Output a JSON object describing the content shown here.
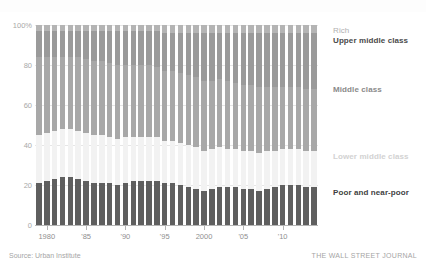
{
  "chart_data": {
    "type": "bar",
    "subtype": "stacked-percentage-column",
    "title": "",
    "xlabel": "",
    "ylabel": "",
    "ylim": [
      0,
      100
    ],
    "ytick_labels": [
      "0",
      "20",
      "40",
      "60",
      "80",
      "100%"
    ],
    "ytick_values": [
      0,
      20,
      40,
      60,
      80,
      100
    ],
    "grid": true,
    "legend_position": "right-inline",
    "x": [
      1979,
      1980,
      1981,
      1982,
      1983,
      1984,
      1985,
      1986,
      1987,
      1988,
      1989,
      1990,
      1991,
      1992,
      1993,
      1994,
      1995,
      1996,
      1997,
      1998,
      1999,
      2000,
      2001,
      2002,
      2003,
      2004,
      2005,
      2006,
      2007,
      2008,
      2009,
      2010,
      2011,
      2012,
      2013,
      2014
    ],
    "xtick_labels": [
      "1980",
      "'85",
      "'90",
      "'95",
      "2000",
      "'05",
      "'10"
    ],
    "xtick_values": [
      1980,
      1985,
      1990,
      1995,
      2000,
      2005,
      2010
    ],
    "series": [
      {
        "name": "Poor and near-poor",
        "color": "#5f5f5f",
        "values": [
          21,
          22,
          23,
          24,
          24,
          23,
          22,
          21,
          21,
          21,
          20,
          21,
          22,
          22,
          22,
          22,
          21,
          21,
          20,
          19,
          18,
          17,
          18,
          19,
          19,
          19,
          18,
          18,
          17,
          18,
          19,
          20,
          20,
          20,
          19,
          19
        ]
      },
      {
        "name": "Lower middle class",
        "color": "#f2f2f2",
        "values": [
          24,
          24,
          24,
          24,
          24,
          24,
          24,
          24,
          24,
          23,
          23,
          23,
          22,
          22,
          22,
          22,
          21,
          21,
          21,
          21,
          21,
          20,
          20,
          20,
          19,
          19,
          19,
          19,
          19,
          19,
          18,
          18,
          18,
          18,
          18,
          18
        ]
      },
      {
        "name": "Middle class",
        "color": "#a8a8a8",
        "values": [
          39,
          38,
          37,
          36,
          36,
          37,
          37,
          37,
          37,
          37,
          37,
          36,
          36,
          36,
          36,
          35,
          35,
          35,
          35,
          35,
          35,
          35,
          34,
          34,
          34,
          33,
          33,
          33,
          33,
          32,
          32,
          31,
          31,
          31,
          31,
          31
        ]
      },
      {
        "name": "Upper middle class",
        "color": "#9a9a9a",
        "values": [
          13,
          13,
          13,
          13,
          13,
          13,
          14,
          15,
          15,
          16,
          17,
          17,
          17,
          17,
          17,
          18,
          19,
          19,
          20,
          21,
          22,
          24,
          24,
          23,
          24,
          25,
          26,
          26,
          27,
          27,
          27,
          27,
          27,
          27,
          28,
          28
        ]
      },
      {
        "name": "Rich",
        "color": "#b4b4b4",
        "values": [
          3,
          3,
          3,
          3,
          3,
          3,
          3,
          3,
          3,
          3,
          3,
          3,
          3,
          3,
          3,
          3,
          4,
          4,
          4,
          4,
          4,
          4,
          4,
          4,
          4,
          4,
          4,
          4,
          4,
          4,
          4,
          4,
          4,
          4,
          4,
          4
        ]
      }
    ]
  },
  "legend_labels": {
    "rich": "Rich",
    "upper_middle": "Upper middle class",
    "middle": "Middle class",
    "lower_middle": "Lower middle class",
    "poor": "Poor and near-poor"
  },
  "footer": {
    "source": "Source: Urban Institute",
    "brand": "THE WALL STREET JOURNAL"
  },
  "colors": {
    "rich": "#b4b4b4",
    "upper_middle": "#9a9a9a",
    "middle": "#a8a8a8",
    "lower_middle": "#f2f2f2",
    "poor": "#5f5f5f",
    "gridline": "#e6e6e6",
    "axis": "#b5b5b5",
    "axis_text": "#a8a8a8"
  }
}
